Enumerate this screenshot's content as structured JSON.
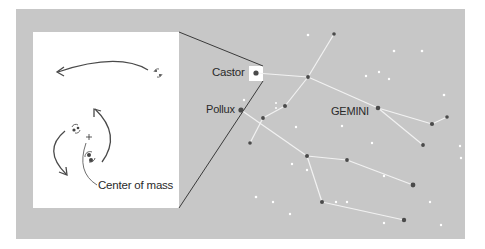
{
  "figure": {
    "constellation_name": "GEMINI",
    "labels": {
      "castor": "Castor",
      "pollux": "Pollux",
      "center_of_mass": "Center of mass"
    },
    "colors": {
      "sky": "#c7c7c7",
      "panel": "#ffffff",
      "star_dark": "#4a4a4a",
      "star_light": "#ffffff",
      "line": "#f2f2f2",
      "ink": "#333333"
    }
  }
}
